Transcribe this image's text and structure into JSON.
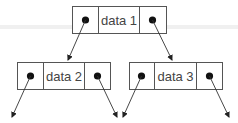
{
  "diagram": {
    "type": "binary-tree-linked-nodes",
    "nodes": [
      {
        "id": "node-1",
        "label": "data 1"
      },
      {
        "id": "node-2",
        "label": "data 2"
      },
      {
        "id": "node-3",
        "label": "data 3"
      }
    ],
    "edges": [
      {
        "from": "node-1.left",
        "to": "node-2"
      },
      {
        "from": "node-1.right",
        "to": "node-3"
      },
      {
        "from": "node-2.left",
        "to": "null"
      },
      {
        "from": "node-2.right",
        "to": "null"
      },
      {
        "from": "node-3.left",
        "to": "null"
      },
      {
        "from": "node-3.right",
        "to": "null"
      }
    ],
    "colors": {
      "stroke": "#555555",
      "text": "#444444",
      "pointer": "#111111"
    }
  }
}
